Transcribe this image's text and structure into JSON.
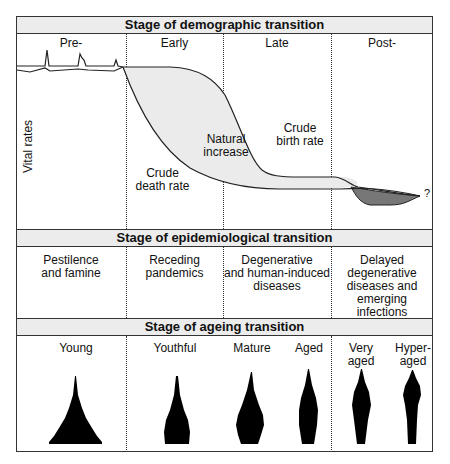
{
  "demographic": {
    "title": "Stage of demographic transition",
    "stages": [
      "Pre-",
      "Early",
      "Late",
      "Post-"
    ],
    "y_axis_label": "Vital rates",
    "curve_labels": {
      "death": [
        "Crude",
        "death rate"
      ],
      "increase": [
        "Natural",
        "increase"
      ],
      "birth": [
        "Crude",
        "birth rate"
      ],
      "question": "?"
    }
  },
  "epidemiological": {
    "title": "Stage of epidemiological transition",
    "stages": [
      [
        "Pestilence",
        "and famine"
      ],
      [
        "Receding",
        "pandemics"
      ],
      [
        "Degenerative",
        "and human-induced",
        "diseases"
      ],
      [
        "Delayed",
        "degenerative",
        "diseases and",
        "emerging infections"
      ]
    ]
  },
  "ageing": {
    "title": "Stage of ageing transition",
    "stages": [
      [
        "Young"
      ],
      [
        "Youthful"
      ],
      [
        "Mature"
      ],
      [
        "Aged"
      ],
      [
        "Very",
        "aged"
      ],
      [
        "Hyper-",
        "aged"
      ]
    ]
  },
  "colors": {
    "header_bg": "#ececec",
    "natural_increase_fill": "#ebebeb",
    "natural_decrease_fill": "#777777",
    "line": "#222222"
  }
}
